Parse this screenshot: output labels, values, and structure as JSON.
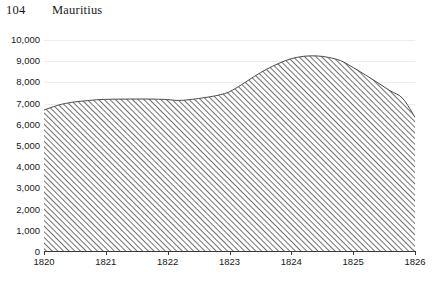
{
  "header": {
    "page_number": "104",
    "title": "Mauritius"
  },
  "chart_data": {
    "type": "area",
    "title": "Mauritius",
    "xlabel": "",
    "ylabel": "",
    "xlim": [
      1820,
      1826
    ],
    "ylim": [
      0,
      10000
    ],
    "grid": true,
    "legend": null,
    "fill_style": "diagonal-hatch",
    "fill_color": "#4d4d4d",
    "grid_color": "#ededed",
    "axis_color": "#3a3a3a",
    "y_ticks": [
      "10,000",
      "9,000",
      "8,000",
      "7,000",
      "6,000",
      "5,000",
      "4,000",
      "3,000",
      "2,000",
      "1,000",
      "0"
    ],
    "y_tick_values": [
      10000,
      9000,
      8000,
      7000,
      6000,
      5000,
      4000,
      3000,
      2000,
      1000,
      0
    ],
    "x_ticks": [
      "1820",
      "1821",
      "1822",
      "1823",
      "1824",
      "1825",
      "1826"
    ],
    "x_tick_values": [
      1820,
      1821,
      1822,
      1823,
      1824,
      1825,
      1826
    ],
    "x": [
      1820.0,
      1820.15,
      1820.3,
      1820.5,
      1820.7,
      1820.85,
      1821.0,
      1821.2,
      1821.4,
      1821.6,
      1821.8,
      1822.0,
      1822.15,
      1822.3,
      1822.5,
      1822.7,
      1822.85,
      1823.0,
      1823.2,
      1823.4,
      1823.6,
      1823.8,
      1824.0,
      1824.2,
      1824.4,
      1824.6,
      1824.8,
      1825.0,
      1825.2,
      1825.4,
      1825.6,
      1825.8,
      1826.0
    ],
    "values": [
      6700,
      6850,
      6980,
      7080,
      7140,
      7180,
      7200,
      7210,
      7215,
      7215,
      7210,
      7190,
      7150,
      7170,
      7240,
      7330,
      7420,
      7560,
      7900,
      8280,
      8620,
      8900,
      9120,
      9230,
      9250,
      9180,
      9020,
      8700,
      8350,
      7980,
      7600,
      7250,
      6350
    ]
  }
}
